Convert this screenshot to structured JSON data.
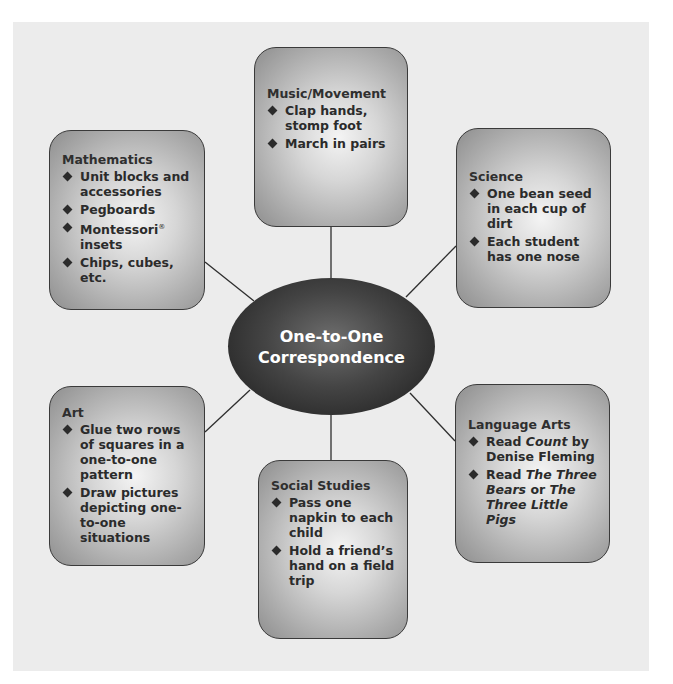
{
  "diagram": {
    "type": "concept-web",
    "center": {
      "line1": "One-to-One",
      "line2": "Correspondence"
    },
    "nodes": {
      "music": {
        "title": "Music/Movement",
        "items": [
          "Clap hands, stomp foot",
          "March in pairs"
        ]
      },
      "math": {
        "title": "Mathematics",
        "items": [
          "Unit blocks and accessories",
          "Pegboards",
          "Montessori",
          "insets",
          "Chips, cubes, etc."
        ],
        "registered_mark": "®"
      },
      "science": {
        "title": "Science",
        "items": [
          "One bean seed in each cup of dirt",
          "Each student has one nose"
        ]
      },
      "art": {
        "title": "Art",
        "items": [
          "Glue two rows of squares in a one-to-one pattern",
          "Draw pictures depicting one-to-one situations"
        ]
      },
      "social": {
        "title": "Social Studies",
        "items": [
          "Pass one napkin to each child",
          "Hold a friend’s hand on a field trip"
        ]
      },
      "language": {
        "title": "Language Arts",
        "item1": {
          "pre": "Read ",
          "italic": "Count",
          "post": " by Denise Fleming"
        },
        "item2": {
          "pre": "Read ",
          "italic1": "The Three Bears",
          "mid": " or ",
          "italic2": "The Three Little Pigs"
        }
      }
    },
    "colors": {
      "panel_bg": "#ececec",
      "box_border": "#3a3a3a",
      "center_fill": "#2a2a2a",
      "center_text": "#ffffff",
      "text": "#2b2b2b",
      "connector": "#2e2e2e"
    }
  }
}
